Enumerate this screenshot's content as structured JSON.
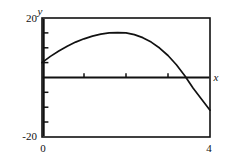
{
  "figure": {
    "axis_labels": {
      "x": "x",
      "y": "y"
    },
    "y_ticks_labeled": {
      "top": "20",
      "bottom": "-20"
    },
    "x_ticks_labeled": {
      "left": "0",
      "right": "4"
    },
    "colors": {
      "frame": "#111111",
      "curve": "#111111",
      "axis": "#111111",
      "background": "#ffffff"
    }
  },
  "chart_data": {
    "type": "line",
    "title": "",
    "xlabel": "x",
    "ylabel": "y",
    "xlim": [
      0,
      4
    ],
    "ylim": [
      -20,
      20
    ],
    "grid": false,
    "legend": null,
    "xticks": [
      0,
      1,
      2,
      3,
      4
    ],
    "xticklabels": [
      "0",
      "",
      "",
      "",
      "4"
    ],
    "yticks": [
      -20,
      -15,
      -10,
      -5,
      0,
      5,
      10,
      15,
      20
    ],
    "yticklabels": [
      "-20",
      "",
      "",
      "",
      "",
      "",
      "",
      "",
      "20"
    ],
    "series": [
      {
        "name": "curve",
        "x": [
          0.0,
          0.2,
          0.4,
          0.6,
          0.8,
          1.0,
          1.2,
          1.4,
          1.6,
          1.8,
          2.0,
          2.2,
          2.4,
          2.6,
          2.8,
          3.0,
          3.2,
          3.4,
          3.6,
          3.8,
          4.0
        ],
        "y": [
          5.0,
          7.1,
          8.9,
          10.5,
          11.9,
          13.0,
          13.9,
          14.6,
          15.0,
          15.1,
          15.0,
          14.4,
          13.4,
          11.9,
          9.9,
          7.4,
          4.3,
          0.6,
          -3.6,
          -7.3,
          -11.0
        ]
      },
      {
        "name": "x-axis-line",
        "x": [
          0.0,
          4.0
        ],
        "y": [
          0.0,
          0.0
        ]
      }
    ]
  }
}
